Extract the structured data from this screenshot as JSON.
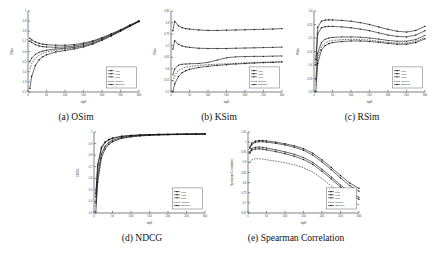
{
  "figure": {
    "panels": [
      {
        "tag": "(a)",
        "caption": "(a) OSim"
      },
      {
        "tag": "(b)",
        "caption": "(b) KSim"
      },
      {
        "tag": "(c)",
        "caption": "(c) RSim"
      },
      {
        "tag": "(d)",
        "caption": "(d) NDCG"
      },
      {
        "tag": "(e)",
        "caption": "(e) Spearman Correlation"
      }
    ],
    "legend_entries": [
      {
        "label": "LM1",
        "marker": "square",
        "style": "solid"
      },
      {
        "label": "LM2",
        "marker": "circle",
        "style": "solid"
      },
      {
        "label": "LM3",
        "marker": "triangle",
        "style": "solid"
      },
      {
        "label": "LinReg",
        "marker": "none",
        "style": "dashed"
      },
      {
        "label": "Baseline",
        "marker": "square",
        "style": "solid"
      }
    ],
    "colors": {
      "line": "#0d0d0d",
      "axis": "#4a4a4a",
      "background": "#ffffff"
    }
  },
  "chart_data": [
    {
      "type": "line",
      "title": "",
      "panel": "(a) OSim",
      "xlabel": "topK",
      "ylabel": "OSim",
      "xlim": [
        0,
        300
      ],
      "ylim": [
        0.2,
        1.0
      ],
      "xticks": [
        0,
        50,
        100,
        150,
        200,
        250,
        300
      ],
      "yticks": [
        0.2,
        0.3,
        0.4,
        0.5,
        0.6,
        0.7,
        0.8,
        0.9,
        1.0
      ],
      "grid": false,
      "legend_position": "right",
      "x": [
        5,
        10,
        20,
        30,
        40,
        50,
        75,
        100,
        125,
        150,
        175,
        200,
        225,
        250,
        275,
        300
      ],
      "series": [
        {
          "name": "LM1",
          "values": [
            0.73,
            0.715,
            0.695,
            0.68,
            0.672,
            0.668,
            0.662,
            0.662,
            0.668,
            0.683,
            0.705,
            0.737,
            0.775,
            0.815,
            0.862,
            0.905
          ]
        },
        {
          "name": "LM2",
          "values": [
            0.705,
            0.69,
            0.668,
            0.655,
            0.648,
            0.645,
            0.642,
            0.645,
            0.655,
            0.672,
            0.698,
            0.73,
            0.768,
            0.81,
            0.855,
            0.9
          ]
        },
        {
          "name": "LM3",
          "values": [
            0.5,
            0.535,
            0.572,
            0.592,
            0.605,
            0.613,
            0.625,
            0.632,
            0.642,
            0.658,
            0.685,
            0.72,
            0.762,
            0.805,
            0.852,
            0.898
          ]
        },
        {
          "name": "LinReg",
          "values": [
            0.425,
            0.482,
            0.535,
            0.565,
            0.583,
            0.595,
            0.612,
            0.622,
            0.635,
            0.652,
            0.68,
            0.715,
            0.758,
            0.802,
            0.85,
            0.896
          ]
        },
        {
          "name": "Baseline",
          "values": [
            0.235,
            0.355,
            0.462,
            0.518,
            0.548,
            0.568,
            0.595,
            0.61,
            0.625,
            0.645,
            0.673,
            0.71,
            0.753,
            0.8,
            0.848,
            0.894
          ]
        }
      ]
    },
    {
      "type": "line",
      "title": "",
      "panel": "(b) KSim",
      "xlabel": "topK",
      "ylabel": "KSim",
      "xlim": [
        0,
        300
      ],
      "ylim": [
        0.5,
        0.85
      ],
      "xticks": [
        0,
        50,
        100,
        150,
        200,
        250,
        300
      ],
      "yticks": [
        0.5,
        0.55,
        0.6,
        0.65,
        0.7,
        0.75,
        0.8,
        0.85
      ],
      "grid": false,
      "legend_position": "right",
      "x": [
        5,
        10,
        20,
        30,
        40,
        50,
        75,
        100,
        125,
        150,
        175,
        200,
        225,
        250,
        275,
        300
      ],
      "series": [
        {
          "name": "LM1",
          "values": [
            0.765,
            0.805,
            0.786,
            0.778,
            0.774,
            0.772,
            0.768,
            0.766,
            0.766,
            0.767,
            0.768,
            0.769,
            0.77,
            0.771,
            0.772,
            0.774
          ]
        },
        {
          "name": "LM2",
          "values": [
            0.685,
            0.722,
            0.706,
            0.699,
            0.695,
            0.693,
            0.689,
            0.688,
            0.688,
            0.688,
            0.689,
            0.69,
            0.691,
            0.692,
            0.693,
            0.694
          ]
        },
        {
          "name": "LM3",
          "values": [
            0.575,
            0.6,
            0.616,
            0.62,
            0.621,
            0.622,
            0.623,
            0.628,
            0.638,
            0.648,
            0.652,
            0.653,
            0.654,
            0.654,
            0.655,
            0.656
          ]
        },
        {
          "name": "LinReg",
          "values": [
            0.545,
            0.572,
            0.593,
            0.602,
            0.607,
            0.61,
            0.615,
            0.618,
            0.62,
            0.622,
            0.624,
            0.626,
            0.628,
            0.629,
            0.63,
            0.631
          ]
        },
        {
          "name": "Baseline",
          "values": [
            0.502,
            0.535,
            0.567,
            0.583,
            0.592,
            0.598,
            0.606,
            0.611,
            0.615,
            0.618,
            0.621,
            0.623,
            0.625,
            0.627,
            0.628,
            0.63
          ]
        }
      ]
    },
    {
      "type": "line",
      "title": "",
      "panel": "(c) RSim",
      "xlabel": "topK",
      "ylabel": "RSim",
      "xlim": [
        0,
        300
      ],
      "ylim": [
        0.3,
        0.6
      ],
      "xticks": [
        0,
        50,
        100,
        150,
        200,
        250,
        300
      ],
      "yticks": [
        0.3,
        0.35,
        0.4,
        0.45,
        0.5,
        0.55,
        0.6
      ],
      "grid": false,
      "legend_position": "right",
      "x": [
        5,
        10,
        20,
        30,
        40,
        50,
        75,
        100,
        125,
        150,
        175,
        200,
        225,
        250,
        275,
        300
      ],
      "series": [
        {
          "name": "LM1",
          "values": [
            0.42,
            0.54,
            0.562,
            0.566,
            0.567,
            0.567,
            0.565,
            0.562,
            0.557,
            0.55,
            0.541,
            0.532,
            0.525,
            0.522,
            0.528,
            0.543
          ]
        },
        {
          "name": "LM2",
          "values": [
            0.4,
            0.515,
            0.538,
            0.542,
            0.543,
            0.543,
            0.541,
            0.538,
            0.533,
            0.527,
            0.519,
            0.511,
            0.506,
            0.504,
            0.511,
            0.527
          ]
        },
        {
          "name": "LM3",
          "values": [
            0.345,
            0.445,
            0.483,
            0.495,
            0.5,
            0.502,
            0.504,
            0.504,
            0.503,
            0.5,
            0.496,
            0.491,
            0.488,
            0.488,
            0.494,
            0.51
          ]
        },
        {
          "name": "LinReg",
          "values": [
            0.325,
            0.425,
            0.468,
            0.482,
            0.488,
            0.491,
            0.494,
            0.495,
            0.494,
            0.492,
            0.488,
            0.484,
            0.481,
            0.481,
            0.487,
            0.502
          ]
        },
        {
          "name": "Baseline",
          "values": [
            0.302,
            0.405,
            0.455,
            0.472,
            0.479,
            0.483,
            0.487,
            0.489,
            0.489,
            0.487,
            0.484,
            0.48,
            0.477,
            0.477,
            0.483,
            0.497
          ]
        }
      ]
    },
    {
      "type": "line",
      "title": "",
      "panel": "(d) NDCG",
      "xlabel": "topK",
      "ylabel": "NDCG",
      "xlim": [
        0,
        300
      ],
      "ylim": [
        0.3,
        1.0
      ],
      "xticks": [
        0,
        50,
        100,
        150,
        200,
        250,
        300
      ],
      "yticks": [
        0.3,
        0.4,
        0.5,
        0.6,
        0.7,
        0.8,
        0.9,
        1.0
      ],
      "grid": false,
      "legend_position": "right",
      "x": [
        5,
        10,
        20,
        30,
        40,
        50,
        75,
        100,
        125,
        150,
        175,
        200,
        225,
        250,
        275,
        300
      ],
      "series": [
        {
          "name": "LM1",
          "values": [
            0.47,
            0.72,
            0.868,
            0.915,
            0.936,
            0.948,
            0.964,
            0.971,
            0.975,
            0.978,
            0.98,
            0.981,
            0.982,
            0.983,
            0.984,
            0.985
          ]
        },
        {
          "name": "LM2",
          "values": [
            0.44,
            0.7,
            0.856,
            0.908,
            0.931,
            0.944,
            0.961,
            0.969,
            0.974,
            0.977,
            0.979,
            0.98,
            0.981,
            0.982,
            0.983,
            0.984
          ]
        },
        {
          "name": "LM3",
          "values": [
            0.385,
            0.63,
            0.812,
            0.878,
            0.911,
            0.929,
            0.953,
            0.964,
            0.97,
            0.974,
            0.977,
            0.978,
            0.98,
            0.981,
            0.982,
            0.983
          ]
        },
        {
          "name": "LinReg",
          "values": [
            0.355,
            0.6,
            0.795,
            0.866,
            0.902,
            0.922,
            0.949,
            0.961,
            0.968,
            0.973,
            0.976,
            0.978,
            0.979,
            0.98,
            0.981,
            0.982
          ]
        },
        {
          "name": "Baseline",
          "values": [
            0.31,
            0.565,
            0.775,
            0.853,
            0.893,
            0.915,
            0.945,
            0.958,
            0.966,
            0.971,
            0.974,
            0.976,
            0.978,
            0.979,
            0.98,
            0.981
          ]
        }
      ]
    },
    {
      "type": "line",
      "title": "",
      "panel": "(e) Spearman Correlation",
      "xlabel": "topK",
      "ylabel": "Spearman Correlation",
      "xlim": [
        0,
        300
      ],
      "ylim": [
        0.65,
        1.05
      ],
      "xticks": [
        0,
        50,
        100,
        150,
        200,
        250,
        300
      ],
      "yticks": [
        0.65,
        0.7,
        0.75,
        0.8,
        0.85,
        0.9,
        0.95,
        1.0,
        1.05
      ],
      "grid": false,
      "legend_position": "right",
      "x": [
        5,
        10,
        20,
        30,
        40,
        50,
        75,
        100,
        125,
        150,
        175,
        200,
        225,
        250,
        275,
        300
      ],
      "series": [
        {
          "name": "LM1",
          "values": [
            0.975,
            0.995,
            1.005,
            1.008,
            1.008,
            1.006,
            1.0,
            0.992,
            0.982,
            0.968,
            0.945,
            0.912,
            0.875,
            0.835,
            0.798,
            0.772
          ]
        },
        {
          "name": "LM2",
          "values": [
            0.968,
            0.988,
            0.999,
            1.002,
            1.002,
            1.0,
            0.994,
            0.986,
            0.975,
            0.96,
            0.936,
            0.902,
            0.864,
            0.823,
            0.785,
            0.758
          ]
        },
        {
          "name": "LM3",
          "values": [
            0.952,
            0.968,
            0.975,
            0.976,
            0.974,
            0.971,
            0.962,
            0.952,
            0.94,
            0.924,
            0.9,
            0.866,
            0.828,
            0.788,
            0.752,
            0.728
          ]
        },
        {
          "name": "LinReg",
          "values": [
            0.9,
            0.912,
            0.918,
            0.918,
            0.916,
            0.913,
            0.906,
            0.898,
            0.888,
            0.874,
            0.852,
            0.82,
            0.784,
            0.746,
            0.712,
            0.69
          ]
        },
        {
          "name": "Baseline",
          "values": [
            0.945,
            0.96,
            0.966,
            0.967,
            0.965,
            0.962,
            0.953,
            0.943,
            0.93,
            0.914,
            0.89,
            0.856,
            0.818,
            0.778,
            0.742,
            0.718
          ]
        }
      ]
    }
  ]
}
